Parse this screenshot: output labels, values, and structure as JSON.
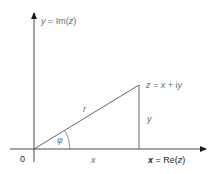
{
  "diagram": {
    "colors": {
      "axis": "#4a4a4a",
      "triangle": "#555555",
      "label": "#5a6f86",
      "label_dark": "#222222",
      "background": "#ffffff"
    },
    "geometry": {
      "origin": [
        34,
        149
      ],
      "point_z": [
        139,
        85
      ],
      "y_axis": {
        "top": 12,
        "bottom": 162
      },
      "x_axis": {
        "left": 10,
        "right": 207
      },
      "phi_arc_radius": 36
    },
    "labels": {
      "y_axis": {
        "var": "y",
        "eq": " = Im(",
        "arg": "z",
        "close": ")"
      },
      "point": {
        "z": "z",
        "eq": " = ",
        "x": "x",
        "plus": " + i",
        "y": "y"
      },
      "hypotenuse": "r",
      "opposite": "y",
      "angle": "φ",
      "adjacent": "x",
      "origin": "0",
      "x_axis": {
        "var": "x",
        "eq": " = Re(",
        "arg": "z",
        "close": ")"
      }
    }
  }
}
